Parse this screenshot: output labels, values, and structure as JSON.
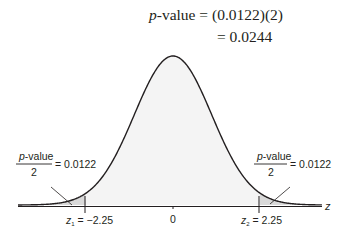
{
  "header": {
    "line1_prefix": "p",
    "line1_rest": "-value = (0.0122)(2)",
    "line2": "= 0.0244"
  },
  "left_annotation": {
    "numerator_italic": "p",
    "numerator_rest": "-value",
    "denominator": "2",
    "equals": "= 0.0122"
  },
  "right_annotation": {
    "numerator_italic": "p",
    "numerator_rest": "-value",
    "denominator": "2",
    "equals": "= 0.0122"
  },
  "axis": {
    "variable": "z",
    "center_label": "0",
    "left_crit_var": "z",
    "left_crit_sub": "1",
    "left_crit_value": " = −2.25",
    "right_crit_var": "z",
    "right_crit_sub": "2",
    "right_crit_value": " = 2.25"
  },
  "colors": {
    "curve": "#231f20",
    "tail_shade": "#d9d9d9",
    "body_shade": "#f4f4f4"
  },
  "chart_data": {
    "type": "area",
    "title": "p-value = (0.0122)(2) = 0.0244",
    "distribution": "standard normal",
    "xlabel": "z",
    "critical_values": [
      -2.25,
      2.25
    ],
    "tail_area_each": 0.0122,
    "p_value": 0.0244,
    "tick_labels": [
      "z1 = -2.25",
      "0",
      "z2 = 2.25"
    ]
  }
}
